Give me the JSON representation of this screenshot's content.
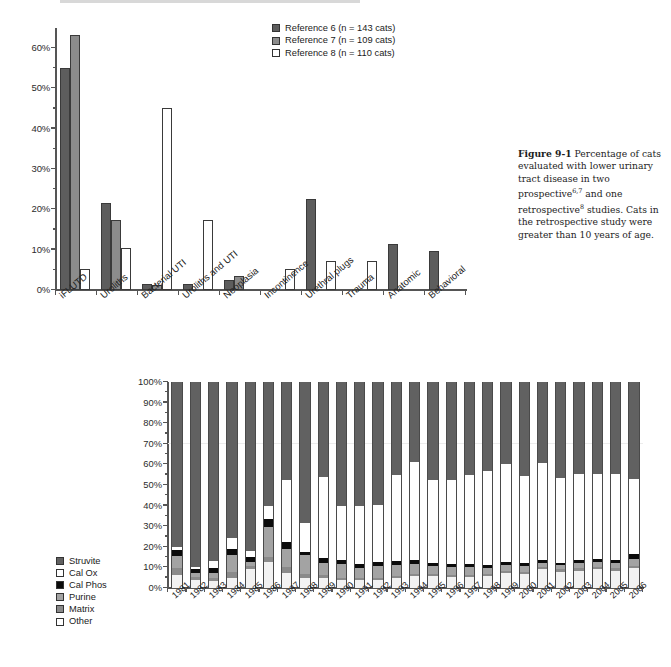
{
  "caption": {
    "figure_number": "Figure 9-1",
    "text_part1": "Percentage of cats evaluated with lower urinary tract disease in two prospective",
    "sup1": "6,7",
    "text_part2": " and one retrospective",
    "sup2": "8",
    "text_part3": " studies. Cats in the retrospective study were greater than 10 years of age."
  },
  "chart_data": [
    {
      "type": "bar",
      "title": "Percentage of cats evaluated with lower urinary tract disease",
      "xlabel": "",
      "ylabel": "",
      "ylim": [
        0,
        65
      ],
      "grid": false,
      "legend_position": "top-right",
      "ytick_labels": [
        "0%",
        "10%",
        "20%",
        "30%",
        "40%",
        "50%",
        "60%"
      ],
      "ytick_values": [
        0,
        10,
        20,
        30,
        40,
        50,
        60
      ],
      "categories": [
        "iFLUTD",
        "Uroliths",
        "Bacterial UTI",
        "Uroliths and UTI",
        "Neoplasia",
        "Incontinence",
        "Urethral plugs",
        "Trauma",
        "Anatomic",
        "Behavioral"
      ],
      "series": [
        {
          "name": "Reference 6 (n = 143 cats)",
          "color": "#5d5d5d",
          "values": [
            55.2,
            21.5,
            1.5,
            1.5,
            2.5,
            0,
            22.6,
            0,
            11.5,
            9.6
          ]
        },
        {
          "name": "Reference 7 (n = 109 cats)",
          "color": "#8c8c8c",
          "values": [
            63.3,
            17.4,
            1.3,
            0,
            3.4,
            0,
            0,
            0,
            0,
            0
          ]
        },
        {
          "name": "Reference 8 (n = 110 cats)",
          "color": "#ffffff",
          "values": [
            5.3,
            10.3,
            45.2,
            17.4,
            0,
            5.3,
            7.3,
            7.3,
            0,
            0
          ]
        }
      ]
    },
    {
      "type": "bar",
      "subtype": "stacked-100",
      "title": "",
      "xlabel": "",
      "ylabel": "",
      "ylim": [
        0,
        100
      ],
      "grid": false,
      "legend_position": "left",
      "ytick_labels": [
        "0%",
        "10%",
        "20%",
        "30%",
        "40%",
        "50%",
        "60%",
        "70%",
        "80%",
        "90%",
        "100%"
      ],
      "ytick_values": [
        0,
        10,
        20,
        30,
        40,
        50,
        60,
        70,
        80,
        90,
        100
      ],
      "categories": [
        "1981",
        "1982",
        "1983",
        "1984",
        "1985",
        "1986",
        "1987",
        "1988",
        "1989",
        "1990",
        "1991",
        "1992",
        "1993",
        "1994",
        "1995",
        "1996",
        "1997",
        "1998",
        "1999",
        "2000",
        "2001",
        "2002",
        "2003",
        "2004",
        "2005",
        "2006"
      ],
      "series": [
        {
          "name": "Other",
          "color": "#f2f2f2",
          "values": [
            6.5,
            4.0,
            3.5,
            5.0,
            9.0,
            12.5,
            7.5,
            5.0,
            5.0,
            4.0,
            4.0,
            4.0,
            5.0,
            6.0,
            6.0,
            5.5,
            5.5,
            6.0,
            7.5,
            7.0,
            9.0,
            8.0,
            8.5,
            9.0,
            8.5,
            9.5
          ]
        },
        {
          "name": "Matrix",
          "color": "#8a8a8a",
          "values": [
            3.0,
            1.5,
            1.5,
            3.0,
            1.5,
            2.5,
            2.5,
            2.0,
            1.5,
            1.0,
            1.0,
            1.0,
            1.0,
            1.0,
            1.0,
            1.0,
            1.0,
            1.0,
            1.0,
            1.0,
            1.0,
            1.0,
            1.0,
            1.0,
            1.0,
            1.0
          ]
        },
        {
          "name": "Purine",
          "color": "#a3a3a3",
          "values": [
            6.0,
            2.0,
            2.5,
            8.0,
            2.0,
            14.5,
            9.0,
            9.0,
            5.5,
            6.5,
            4.5,
            5.5,
            5.0,
            4.5,
            3.5,
            3.5,
            3.5,
            2.5,
            2.5,
            2.5,
            2.0,
            2.0,
            2.5,
            2.5,
            2.5,
            3.5
          ]
        },
        {
          "name": "Cal Phos",
          "color": "#0b0b0b",
          "values": [
            3.0,
            1.5,
            2.0,
            3.0,
            2.5,
            4.0,
            3.5,
            1.5,
            2.5,
            2.0,
            2.0,
            2.0,
            2.0,
            2.0,
            1.5,
            1.5,
            1.5,
            1.5,
            1.5,
            1.5,
            1.5,
            1.0,
            1.5,
            1.5,
            1.5,
            2.5
          ]
        },
        {
          "name": "Cal Ox",
          "color": "#ffffff",
          "values": [
            1.5,
            1.0,
            3.5,
            5.5,
            3.0,
            6.5,
            30.0,
            14.0,
            39.5,
            26.5,
            28.5,
            28.0,
            42.0,
            47.5,
            40.5,
            41.0,
            43.5,
            46.0,
            47.5,
            42.5,
            47.0,
            41.5,
            42.0,
            41.5,
            42.0,
            36.5
          ]
        },
        {
          "name": "Struvite",
          "color": "#616161",
          "values": [
            80.0,
            90.0,
            87.0,
            75.5,
            82.0,
            60.0,
            47.5,
            68.5,
            46.0,
            60.0,
            60.0,
            59.5,
            45.0,
            39.0,
            47.5,
            47.5,
            45.0,
            43.0,
            40.0,
            45.5,
            39.5,
            46.5,
            44.5,
            44.5,
            44.5,
            47.0
          ]
        }
      ],
      "legend_entries": [
        {
          "label": "Struvite",
          "color": "#616161"
        },
        {
          "label": "Cal Ox",
          "color": "#ffffff"
        },
        {
          "label": "Cal Phos",
          "color": "#0b0b0b"
        },
        {
          "label": "Purine",
          "color": "#a3a3a3"
        },
        {
          "label": "Matrix",
          "color": "#8a8a8a"
        },
        {
          "label": "Other",
          "color": "#ffffff"
        }
      ]
    }
  ]
}
